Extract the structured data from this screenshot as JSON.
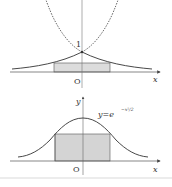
{
  "figure_top": {
    "curves": [
      "y=e^x (dashed)",
      "y=e^{-x} (dashed, rising left)",
      "y=e^{-|x|} (solid)"
    ],
    "intercept_label": "1",
    "origin_label": "O",
    "x_axis_label": "x"
  },
  "figure_bottom": {
    "function_label_base": "y=e",
    "function_label_exponent": "−x²/2",
    "origin_label": "O",
    "x_axis_label": "x",
    "y_axis_label": "y"
  },
  "colors": {
    "curve": "#333333",
    "shade": "#d9d9d9",
    "axis": "#555555"
  }
}
